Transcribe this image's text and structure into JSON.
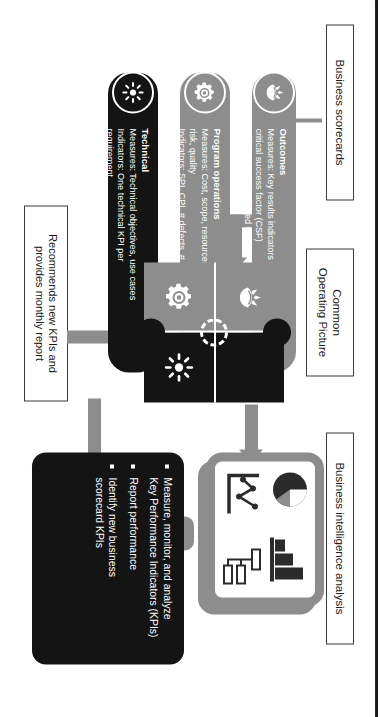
{
  "headers": {
    "scorecards": "Business scorecards",
    "cop_line1": "Common",
    "cop_line2": "Operating Picture",
    "bi": "Business intelligence analysis",
    "feedback_line1": "Recommends new KPIs and",
    "feedback_line2": "provides monthly report"
  },
  "scorecards": [
    {
      "id": "outcomes",
      "title": "Outcomes",
      "icon": "hand-growth-icon",
      "lines": [
        "Measures: Key results indicators (KRI) per",
        "critical success factor (CSF)",
        "Indicators: KPIs aligned to KRIs"
      ],
      "color": "#8d8d8d"
    },
    {
      "id": "program-operations",
      "title": "Program operations",
      "icon": "gear-icon",
      "lines": [
        "Measures: Cost, scope, resources, time,",
        "risk, quality",
        "Indicators: SPI, CPI, # defects, # changes"
      ],
      "color": "#8d8d8d"
    },
    {
      "id": "technical",
      "title": "Technical",
      "icon": "starburst-icon",
      "lines": [
        "Measures: Technical objectives, use cases",
        "Indicators: One technical KPI per",
        "requirement"
      ],
      "color": "#141414"
    }
  ],
  "common_operating_picture": {
    "pieces": [
      {
        "position": "top-left",
        "icon": "hand-growth-icon",
        "color": "#8d8d8d"
      },
      {
        "position": "top-right",
        "icon": "none",
        "color": "#141414"
      },
      {
        "position": "bottom-left",
        "icon": "gear-icon",
        "color": "#8d8d8d"
      },
      {
        "position": "bottom-right",
        "icon": "starburst-icon",
        "color": "#141414"
      }
    ]
  },
  "business_intelligence": {
    "monitor_icons": [
      "pie-chart-icon",
      "bar-chart-icon",
      "line-chart-icon",
      "org-tree-icon"
    ],
    "bullets": [
      "Measure, monitor, and analyze\nKey Performance Indicators (KPIs)",
      "Report performance",
      "Identify new business\nscorecard KPIs"
    ]
  },
  "colors": {
    "gray": "#8d8d8d",
    "black": "#141414",
    "white": "#ffffff",
    "border": "#3b3b3b"
  }
}
